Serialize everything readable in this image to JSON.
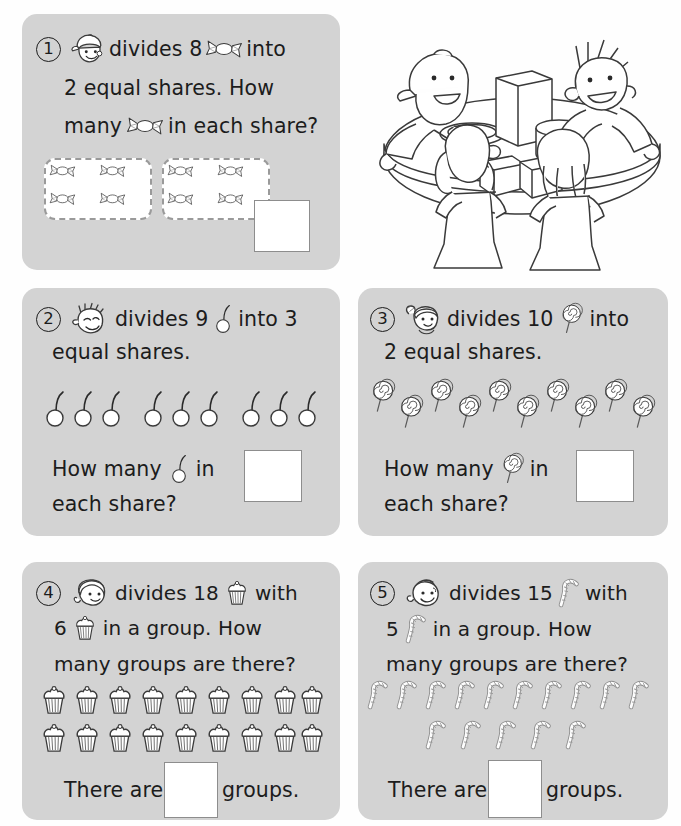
{
  "page": {
    "background": "#fefefe",
    "card_fill": "#d3d3d3",
    "ink": "#1c1c1c",
    "box_border": "#8d8d8d",
    "dash_border": "#9a9a9a",
    "topic": "Division - equal shares and grouping"
  },
  "illustration": {
    "name": "four-children-around-table",
    "description": "Four children seated around a round table with boxes and a plate",
    "children_count": 4
  },
  "questions": [
    {
      "number": "1",
      "face_icon": "boy-with-cap-face-icon",
      "item_icon": "wrapped-candy-icon",
      "item_name": "candy",
      "lines": [
        {
          "parts": [
            "divides 8",
            "ICON",
            "into"
          ]
        },
        {
          "parts": [
            "2 equal shares.  How"
          ]
        },
        {
          "parts": [
            "many",
            "ICON",
            "in each share?"
          ]
        }
      ],
      "total": 8,
      "shares": 2,
      "operation": "equal-shares",
      "groups_shown": 2,
      "items_per_group": 4,
      "answer_value": "",
      "answer_label": ""
    },
    {
      "number": "2",
      "face_icon": "spiky-hair-boy-face-icon",
      "item_icon": "balloon-icon",
      "item_name": "balloon",
      "lines": [
        {
          "parts": [
            "divides 9",
            "ICON",
            "into 3"
          ]
        },
        {
          "parts": [
            "equal shares."
          ]
        }
      ],
      "question_line": {
        "parts": [
          "How many",
          "ICON",
          "in"
        ]
      },
      "question_line2": "each share?",
      "total": 9,
      "shares": 3,
      "operation": "equal-shares",
      "groups_shown": 3,
      "items_per_group": 3,
      "answer_value": ""
    },
    {
      "number": "3",
      "face_icon": "girl-with-ponytail-face-icon",
      "item_icon": "lollipop-icon",
      "item_name": "lollipop",
      "lines": [
        {
          "parts": [
            "divides 10",
            "ICON",
            "into"
          ]
        },
        {
          "parts": [
            "2 equal shares."
          ]
        }
      ],
      "question_line": {
        "parts": [
          "How many",
          "ICON",
          "in"
        ]
      },
      "question_line2": "each share?",
      "total": 10,
      "shares": 2,
      "operation": "equal-shares",
      "answer_value": ""
    },
    {
      "number": "4",
      "face_icon": "girl-short-hair-face-icon",
      "item_icon": "cupcake-icon",
      "item_name": "cupcake",
      "lines": [
        {
          "parts": [
            "divides 18",
            "ICON",
            "with"
          ]
        },
        {
          "parts": [
            "6",
            "ICON",
            "in a group.  How"
          ]
        },
        {
          "parts": [
            "many groups are there?"
          ]
        }
      ],
      "total": 18,
      "per_group": 6,
      "operation": "grouping",
      "rows": [
        9,
        9
      ],
      "answer_prefix": "There are",
      "answer_suffix": "groups.",
      "answer_value": ""
    },
    {
      "number": "5",
      "face_icon": "boy-round-face-icon",
      "item_icon": "candy-cane-icon",
      "item_name": "candy cane",
      "lines": [
        {
          "parts": [
            "divides 15",
            "ICON",
            "with"
          ]
        },
        {
          "parts": [
            "5",
            "ICON",
            "in a group.  How"
          ]
        },
        {
          "parts": [
            "many groups are there?"
          ]
        }
      ],
      "total": 15,
      "per_group": 5,
      "operation": "grouping",
      "rows": [
        10,
        5
      ],
      "answer_prefix": "There are",
      "answer_suffix": "groups.",
      "answer_value": ""
    }
  ],
  "text": {
    "q1_l1_a": "divides 8",
    "q1_l1_b": "into",
    "q1_l2": "2 equal shares.  How",
    "q1_l3_a": "many",
    "q1_l3_b": "in each share?",
    "q2_l1_a": "divides 9",
    "q2_l1_b": "into 3",
    "q2_l2": "equal shares.",
    "q2_q_a": "How many",
    "q2_q_b": "in",
    "q2_q_c": "each share?",
    "q3_l1_a": "divides 10",
    "q3_l1_b": "into",
    "q3_l2": "2 equal shares.",
    "q3_q_a": "How many",
    "q3_q_b": "in",
    "q3_q_c": "each share?",
    "q4_l1_a": "divides 18",
    "q4_l1_b": "with",
    "q4_l2_a": "6",
    "q4_l2_b": "in a group.  How",
    "q4_l3": "many groups are there?",
    "q4_ans_a": "There are",
    "q4_ans_b": "groups.",
    "q5_l1_a": "divides 15",
    "q5_l1_b": "with",
    "q5_l2_a": "5",
    "q5_l2_b": "in a group.  How",
    "q5_l3": "many groups are there?",
    "q5_ans_a": "There are",
    "q5_ans_b": "groups.",
    "n1": "1",
    "n2": "2",
    "n3": "3",
    "n4": "4",
    "n5": "5"
  }
}
